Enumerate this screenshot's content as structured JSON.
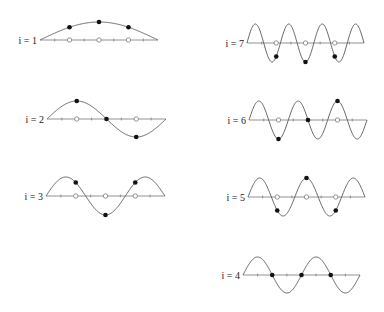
{
  "figure": {
    "colors": {
      "curve": "#555555",
      "axis": "#777777",
      "dot": "#111111",
      "open_circle": "#888888",
      "label": "#222222"
    },
    "panels": [
      {
        "i": 1,
        "label": "i = 1",
        "x0": 40,
        "x1": 158,
        "y": 40,
        "amp": 18,
        "column": "left"
      },
      {
        "i": 2,
        "label": "i = 2",
        "x0": 47,
        "x1": 166,
        "y": 119,
        "amp": 18,
        "column": "left"
      },
      {
        "i": 3,
        "label": "i = 3",
        "x0": 46,
        "x1": 165,
        "y": 196,
        "amp": 19,
        "column": "left"
      },
      {
        "i": 7,
        "label": "i = 7",
        "x0": 247,
        "x1": 364,
        "y": 43,
        "amp": 19,
        "column": "right"
      },
      {
        "i": 6,
        "label": "i = 6",
        "x0": 249,
        "x1": 367,
        "y": 120,
        "amp": 19,
        "column": "right"
      },
      {
        "i": 5,
        "label": "i = 5",
        "x0": 248,
        "x1": 365,
        "y": 197,
        "amp": 19,
        "column": "right"
      },
      {
        "i": 4,
        "label": "i = 4",
        "x0": 243,
        "x1": 360,
        "y": 275,
        "amp": 18,
        "column": "right"
      }
    ],
    "sample_points_t": [
      0.25,
      0.5,
      0.75
    ],
    "tick_count": 8
  }
}
